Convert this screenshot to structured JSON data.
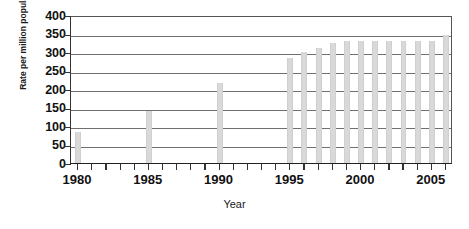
{
  "chart_data": {
    "type": "bar",
    "title": "",
    "xlabel": "Year",
    "ylabel": "Rate per million population",
    "ylim": [
      0,
      400
    ],
    "ytick_values": [
      0,
      50,
      100,
      150,
      200,
      250,
      300,
      350,
      400
    ],
    "ytick_labels": [
      "0",
      "50",
      "100",
      "150",
      "200",
      "250",
      "300",
      "350",
      "400"
    ],
    "xlim": [
      1979.5,
      2006.5
    ],
    "xtick_labels": [
      "1980",
      "1985",
      "1990",
      "1995",
      "2000",
      "2005"
    ],
    "xtick_values": [
      1980,
      1985,
      1990,
      1995,
      2000,
      2005
    ],
    "grid": true,
    "legend": false,
    "bar_color": "#d9d9d9",
    "axis_color": "#333333",
    "gridline_color": "#6f6f6f",
    "categories": [
      1980,
      1981,
      1982,
      1983,
      1984,
      1985,
      1986,
      1987,
      1988,
      1989,
      1990,
      1991,
      1992,
      1993,
      1994,
      1995,
      1996,
      1997,
      1998,
      1999,
      2000,
      2001,
      2002,
      2003,
      2004,
      2005,
      2006
    ],
    "values": [
      85,
      0,
      0,
      0,
      0,
      140,
      0,
      0,
      0,
      0,
      215,
      0,
      0,
      0,
      0,
      285,
      300,
      310,
      325,
      330,
      330,
      330,
      330,
      330,
      330,
      330,
      345
    ]
  }
}
